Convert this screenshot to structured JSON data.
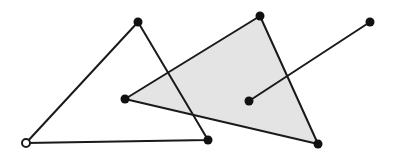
{
  "diagram": {
    "colors": {
      "stroke": "#1a1a1a",
      "shade_fill": "#e4e4e4",
      "point_fill": "#111111",
      "hollow_point_fill": "#ffffff",
      "background": "#ffffff"
    },
    "shapes": [
      {
        "name": "outline-triangle",
        "type": "triangle",
        "filled": false
      },
      {
        "name": "shaded-triangle",
        "type": "triangle",
        "filled": true
      },
      {
        "name": "segment",
        "type": "line-segment"
      }
    ],
    "points": [
      {
        "name": "outline-triangle-apex",
        "style": "filled"
      },
      {
        "name": "outline-triangle-bottom-left",
        "style": "hollow"
      },
      {
        "name": "outline-triangle-bottom-right",
        "style": "filled"
      },
      {
        "name": "shaded-triangle-left",
        "style": "filled"
      },
      {
        "name": "shaded-triangle-top",
        "style": "filled"
      },
      {
        "name": "shaded-triangle-bottom",
        "style": "filled"
      },
      {
        "name": "segment-interior-endpoint",
        "style": "filled"
      },
      {
        "name": "segment-exterior-endpoint",
        "style": "filled"
      }
    ]
  }
}
